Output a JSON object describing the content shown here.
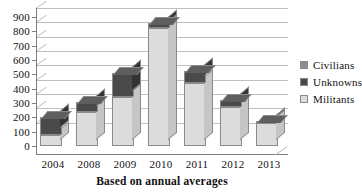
{
  "chart_data": {
    "type": "bar",
    "subtype": "stacked-column-3d",
    "title": "",
    "xlabel": "Based on annual averages",
    "ylabel": "",
    "categories": [
      "2004",
      "2008",
      "2009",
      "2010",
      "2011",
      "2012",
      "2013"
    ],
    "series": [
      {
        "name": "Militants",
        "color": "#dcdcdc",
        "values": [
          80,
          240,
          340,
          820,
          440,
          270,
          160
        ]
      },
      {
        "name": "Unknowns",
        "color": "#4a4a4a",
        "values": [
          120,
          70,
          170,
          35,
          80,
          50,
          15
        ]
      },
      {
        "name": "Civilians",
        "color": "#8e8e8e",
        "values": [
          0,
          0,
          0,
          0,
          0,
          0,
          0
        ]
      }
    ],
    "totals": [
      200,
      310,
      510,
      855,
      520,
      320,
      175
    ],
    "ylim": [
      0,
      900
    ],
    "ytick_step": 100,
    "yticks": [
      "0",
      "100",
      "200",
      "300",
      "400",
      "500",
      "600",
      "700",
      "800",
      "900"
    ],
    "grid": true,
    "legend_position": "right",
    "legend_entries": [
      "Civilians",
      "Unknowns",
      "Militants"
    ]
  },
  "axis": {
    "x_title": "Based on annual averages"
  },
  "legend": {
    "items": [
      {
        "label": "Civilians",
        "color": "#8e8e8e"
      },
      {
        "label": "Unknowns",
        "color": "#4a4a4a"
      },
      {
        "label": "Militants",
        "color": "#dcdcdc"
      }
    ]
  }
}
